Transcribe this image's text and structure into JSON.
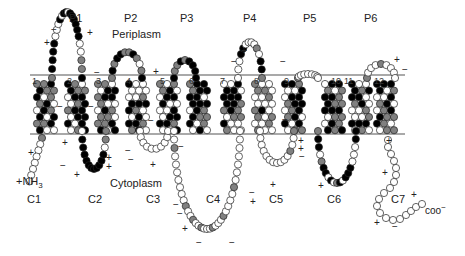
{
  "diagram": {
    "type": "membrane-topology",
    "regions": {
      "periplasm": "Periplasm",
      "cytoplasm": "Cytoplasm"
    },
    "n_terminus": "+NH",
    "n_terminus_sub": "3",
    "c_terminus": "coo",
    "c_terminus_sup": "−",
    "periplasmic_loops": [
      {
        "label": "P1",
        "x": 69,
        "y": 13
      },
      {
        "label": "P2",
        "x": 124,
        "y": 13
      },
      {
        "label": "P3",
        "x": 180,
        "y": 13
      },
      {
        "label": "P4",
        "x": 243,
        "y": 13
      },
      {
        "label": "P5",
        "x": 303,
        "y": 13
      },
      {
        "label": "P6",
        "x": 364,
        "y": 13
      }
    ],
    "cytoplasmic_loops": [
      {
        "label": "C1",
        "x": 27,
        "y": 194
      },
      {
        "label": "C2",
        "x": 88,
        "y": 194
      },
      {
        "label": "C3",
        "x": 146,
        "y": 194
      },
      {
        "label": "C4",
        "x": 206,
        "y": 194
      },
      {
        "label": "C5",
        "x": 269,
        "y": 194
      },
      {
        "label": "C6",
        "x": 327,
        "y": 194
      },
      {
        "label": "C7",
        "x": 391,
        "y": 194
      }
    ],
    "helices": [
      {
        "n": "1",
        "x": 32
      },
      {
        "n": "2",
        "x": 67
      },
      {
        "n": "3",
        "x": 96
      },
      {
        "n": "4",
        "x": 126
      },
      {
        "n": "5",
        "x": 160
      },
      {
        "n": "6",
        "x": 189
      },
      {
        "n": "7",
        "x": 220
      },
      {
        "n": "8",
        "x": 254
      },
      {
        "n": "9",
        "x": 284
      },
      {
        "n": "10",
        "x": 331
      },
      {
        "n": "11",
        "x": 344
      },
      {
        "n": "12",
        "x": 374
      }
    ],
    "legend_colors": {
      "hydrophobic": "#000000",
      "intermediate": "#808080",
      "polar": "#ffffff",
      "outline": "#222222",
      "membrane_line": "#555555"
    },
    "membrane": {
      "top_y": 75,
      "bottom_y": 134,
      "x_start": 30,
      "x_end": 405
    },
    "charges": [
      {
        "s": "−",
        "x": 51,
        "y": 25
      },
      {
        "s": "+",
        "x": 87,
        "y": 28
      },
      {
        "s": "+",
        "x": 44,
        "y": 38
      },
      {
        "s": "−",
        "x": 94,
        "y": 68
      },
      {
        "s": "+",
        "x": 153,
        "y": 67
      },
      {
        "s": "+",
        "x": 241,
        "y": 46
      },
      {
        "s": "−",
        "x": 231,
        "y": 57
      },
      {
        "s": "−",
        "x": 280,
        "y": 57
      },
      {
        "s": "+",
        "x": 394,
        "y": 55
      },
      {
        "s": "−",
        "x": 402,
        "y": 65
      },
      {
        "s": "−",
        "x": 57,
        "y": 102
      },
      {
        "s": "−",
        "x": 88,
        "y": 102
      },
      {
        "s": "−",
        "x": 148,
        "y": 116
      },
      {
        "s": "−",
        "x": 282,
        "y": 115
      },
      {
        "s": "+",
        "x": 28,
        "y": 148
      },
      {
        "s": "+",
        "x": 62,
        "y": 138
      },
      {
        "s": "−",
        "x": 60,
        "y": 161
      },
      {
        "s": "+",
        "x": 74,
        "y": 170
      },
      {
        "s": "+",
        "x": 106,
        "y": 153
      },
      {
        "s": "+",
        "x": 106,
        "y": 162
      },
      {
        "s": "+",
        "x": 150,
        "y": 160
      },
      {
        "s": "−",
        "x": 125,
        "y": 146
      },
      {
        "s": "−",
        "x": 128,
        "y": 155
      },
      {
        "s": "−",
        "x": 178,
        "y": 142
      },
      {
        "s": "−",
        "x": 173,
        "y": 200
      },
      {
        "s": "−",
        "x": 177,
        "y": 209
      },
      {
        "s": "+",
        "x": 182,
        "y": 224
      },
      {
        "s": "−",
        "x": 196,
        "y": 238
      },
      {
        "s": "−",
        "x": 229,
        "y": 238
      },
      {
        "s": "−",
        "x": 249,
        "y": 188
      },
      {
        "s": "+",
        "x": 250,
        "y": 197
      },
      {
        "s": "+",
        "x": 298,
        "y": 136
      },
      {
        "s": "+",
        "x": 298,
        "y": 144
      },
      {
        "s": "−",
        "x": 299,
        "y": 152
      },
      {
        "s": "+",
        "x": 270,
        "y": 180
      },
      {
        "s": "+",
        "x": 318,
        "y": 181
      },
      {
        "s": "+",
        "x": 386,
        "y": 136
      },
      {
        "s": "+",
        "x": 382,
        "y": 168
      },
      {
        "s": "+",
        "x": 411,
        "y": 190
      },
      {
        "s": "+",
        "x": 374,
        "y": 218
      },
      {
        "s": "−",
        "x": 392,
        "y": 222
      }
    ]
  }
}
